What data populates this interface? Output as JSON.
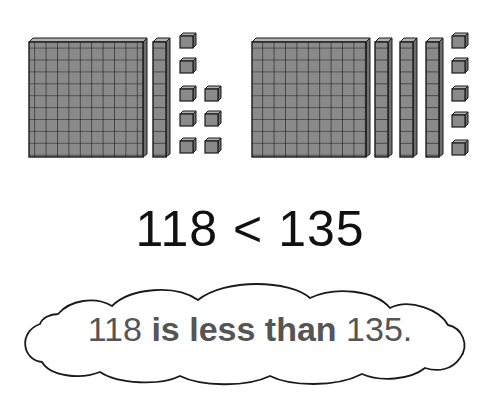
{
  "left_group": {
    "value": 118,
    "hundreds": 1,
    "tens": 1,
    "ones": 8
  },
  "right_group": {
    "value": 135,
    "hundreds": 1,
    "tens": 3,
    "ones": 5
  },
  "comparison": {
    "left": "118",
    "symbol": "<",
    "right": "135"
  },
  "sentence": {
    "first_number": "118",
    "phrase": "is less than",
    "second_number": "135."
  },
  "colors": {
    "block_fill": "#8a8a8a",
    "block_top": "#b0b0b0",
    "block_side": "#6e6e6e",
    "outline": "#1a1a1a",
    "text": "#111111",
    "cloud_text": "#555555"
  }
}
